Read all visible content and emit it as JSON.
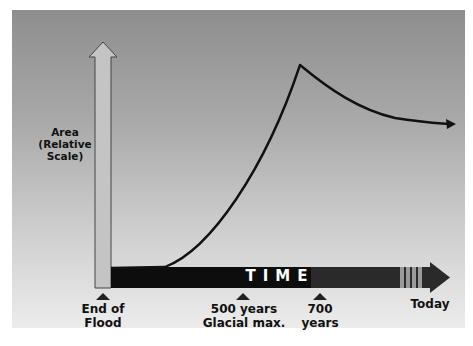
{
  "diagram": {
    "y_axis_label_line1": "Area",
    "y_axis_label_line2": "(Relative Scale)",
    "time_label": "TIME",
    "markers": [
      {
        "line1": "End of",
        "line2": "Flood"
      },
      {
        "line1": "500 years",
        "line2": "Glacial max."
      },
      {
        "line1": "700",
        "line2": "years"
      },
      {
        "line1": "Today",
        "line2": ""
      }
    ],
    "curve_description": "Area flat after flood, rises to peak at glacial maximum, then declines toward today"
  }
}
